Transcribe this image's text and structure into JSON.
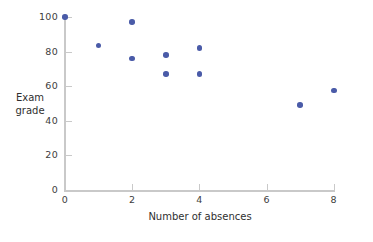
{
  "chart_data": {
    "type": "scatter",
    "title": "",
    "xlabel": "Number of absences",
    "ylabel": "Exam grade",
    "ylabel_lines": [
      "Exam",
      "grade"
    ],
    "xlim": [
      0,
      8.1
    ],
    "ylim": [
      0,
      100
    ],
    "xticks": [
      0,
      2,
      4,
      6,
      8
    ],
    "xtick_labels": [
      "0",
      "2",
      "4",
      "6",
      "8"
    ],
    "yticks": [
      0,
      20,
      40,
      60,
      80,
      100
    ],
    "ytick_labels": [
      "0",
      "20",
      "40",
      "60",
      "80",
      "100"
    ],
    "grid": false,
    "legend": false,
    "marker_color": "#4a5ba8",
    "axis_color": "#c9c9c9",
    "text_color": "#3d3d3d",
    "background": "#ffffff",
    "points": [
      {
        "x": 0,
        "y": 100
      },
      {
        "x": 1,
        "y": 83.5
      },
      {
        "x": 2,
        "y": 97
      },
      {
        "x": 2,
        "y": 76
      },
      {
        "x": 3,
        "y": 78
      },
      {
        "x": 3,
        "y": 67
      },
      {
        "x": 4,
        "y": 82
      },
      {
        "x": 4,
        "y": 67
      },
      {
        "x": 7,
        "y": 49
      },
      {
        "x": 8,
        "y": 57.5
      }
    ]
  }
}
